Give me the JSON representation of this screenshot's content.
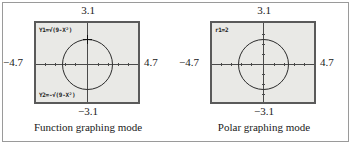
{
  "figure": {
    "panels": [
      {
        "id": "function-graphing",
        "caption": "Function graphing mode",
        "window": {
          "top": "3.1",
          "bottom": "−3.1",
          "left": "−4.7",
          "right": "4.7"
        },
        "equations": [
          {
            "id": "y1",
            "text": "Y1=√(9-X²)",
            "position": "top"
          },
          {
            "id": "y2",
            "text": "Y2=-√(9-X²)",
            "position": "bottom"
          }
        ],
        "plot": {
          "shape": "circle",
          "center": [
            0,
            0
          ],
          "radius": 3,
          "cursor": {
            "visible": true,
            "at": [
              0,
              3
            ]
          }
        }
      },
      {
        "id": "polar-graphing",
        "caption": "Polar graphing mode",
        "window": {
          "top": "3.1",
          "bottom": "−3.1",
          "left": "−4.7",
          "right": "4.7"
        },
        "equations": [
          {
            "id": "r1",
            "text": "r1=2",
            "position": "top"
          }
        ],
        "plot": {
          "shape": "circle",
          "center": [
            0,
            0
          ],
          "radius": 2,
          "cursor": {
            "visible": false
          }
        }
      }
    ],
    "colors": {
      "screen_background": "#e9e9e6",
      "screen_border": "#5a5a5a",
      "axis": "#4a4a4a",
      "curve": "#2b2b2b",
      "frame": "#9a9a9a",
      "text": "#1a1a1a"
    }
  }
}
